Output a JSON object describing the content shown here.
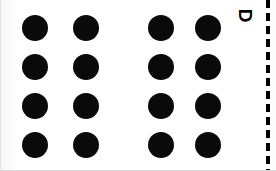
{
  "figure": {
    "panel_label": "D",
    "panel_label_rotation_deg": 90,
    "background_color": "#fefefe",
    "dot_color": "#0a0a0a",
    "divider_color": "#000000",
    "width": 276,
    "height": 171
  },
  "stimulus": {
    "type": "dot-grid",
    "rows": 4,
    "columns": 4,
    "total_dots": 16,
    "dot_diameter": 26,
    "groups": [
      {
        "name": "left-group",
        "columns": 2
      },
      {
        "name": "right-group",
        "columns": 2
      }
    ],
    "column_x": [
      21,
      72,
      147,
      194
    ],
    "row_y": [
      15,
      54,
      93,
      132
    ],
    "column_gap_within_group": 25,
    "column_gap_between_groups": 49,
    "row_gap": 13
  },
  "label": {
    "x": 238,
    "y": 6,
    "font_size": 19
  },
  "divider": {
    "x": 265,
    "y": 0,
    "width": 4,
    "height": 171,
    "dash_length": 8,
    "dash_gap": 5
  }
}
